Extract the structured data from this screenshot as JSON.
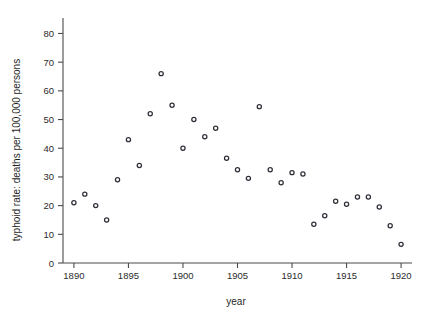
{
  "chart_data": {
    "type": "scatter",
    "title": "",
    "xlabel": "year",
    "ylabel": "typhoid rate: deaths per 100,000 persons",
    "xlim": [
      1889,
      1921
    ],
    "ylim": [
      0,
      84
    ],
    "grid": false,
    "legend": null,
    "xticks": [
      1890,
      1895,
      1900,
      1905,
      1910,
      1915,
      1920
    ],
    "yticks": [
      0,
      10,
      20,
      30,
      40,
      50,
      60,
      70,
      80
    ],
    "x": [
      1890,
      1891,
      1892,
      1893,
      1894,
      1895,
      1896,
      1897,
      1898,
      1899,
      1900,
      1901,
      1902,
      1903,
      1904,
      1905,
      1906,
      1907,
      1908,
      1909,
      1910,
      1911,
      1912,
      1913,
      1914,
      1915,
      1916,
      1917,
      1918,
      1919,
      1920
    ],
    "values": [
      21,
      24,
      20,
      15,
      29,
      43,
      34,
      52,
      66,
      55,
      40,
      50,
      44,
      47,
      36.5,
      32.5,
      29.5,
      54.5,
      32.5,
      28,
      31.5,
      31,
      13.5,
      16.5,
      21.5,
      20.5,
      23,
      23,
      19.5,
      13,
      6.5
    ],
    "series": [
      {
        "name": "typhoid rate",
        "marker": "open-circle",
        "color": "#2e2e38",
        "values": [
          21,
          24,
          20,
          15,
          29,
          43,
          34,
          52,
          66,
          55,
          40,
          50,
          44,
          47,
          36.5,
          32.5,
          29.5,
          54.5,
          32.5,
          28,
          31.5,
          31,
          13.5,
          16.5,
          21.5,
          20.5,
          23,
          23,
          19.5,
          13,
          6.5
        ]
      }
    ]
  },
  "axes": {
    "x_title": "year",
    "y_title": "typhoid rate: deaths per 100,000 persons",
    "x_tick_labels": [
      "1890",
      "1895",
      "1900",
      "1905",
      "1910",
      "1915",
      "1920"
    ],
    "y_tick_labels": [
      "0",
      "10",
      "20",
      "30",
      "40",
      "50",
      "60",
      "70",
      "80"
    ]
  },
  "style": {
    "axis_color": "#4a4a4a",
    "marker_edge_color": "#2e2e38",
    "marker_fill_color": "#ffffff",
    "background": "#ffffff",
    "text_color": "#1f1f1f"
  }
}
